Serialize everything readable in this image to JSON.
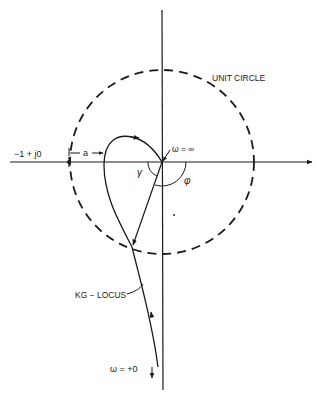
{
  "diagram": {
    "type": "nyquist-plot",
    "labels": {
      "unit_circle": "UNIT CIRCLE",
      "critical_point": "−1 + j0",
      "omega_inf": "ω = ∞",
      "omega_zero": "ω = +0",
      "locus": "KG − LOCUS",
      "gain_margin": "a",
      "gamma": "γ",
      "phi": "φ"
    },
    "colors": {
      "ink": "#1a1a1a",
      "background": "#ffffff"
    }
  }
}
